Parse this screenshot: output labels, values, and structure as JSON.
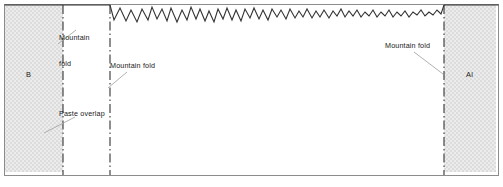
{
  "figure": {
    "type": "papercraft-fold-diagram",
    "frame": {
      "x": 4,
      "y": 4,
      "width": 495,
      "height": 172
    },
    "colors": {
      "line": "#333333",
      "frame": "#8c8c8c",
      "shading": "#e0e0e0",
      "leader": "#a8a8a8",
      "text": "#1a1a1a",
      "background": "#ffffff"
    }
  },
  "panels": [
    {
      "name": "left-tab-panel",
      "label": "B",
      "label_x": 26,
      "label_y": 70,
      "x": 4,
      "y": 4,
      "width": 59,
      "height": 168,
      "shaded": true
    },
    {
      "name": "right-tab-panel",
      "label": "Al",
      "label_x": 466,
      "label_y": 70,
      "x": 444,
      "y": 4,
      "width": 52,
      "height": 168,
      "shaded": true
    }
  ],
  "fold_lines": [
    {
      "name": "fold-line-left-panel-edge",
      "x": 63,
      "y1": 4,
      "y2": 174,
      "style": "dash-dot"
    },
    {
      "name": "fold-line-inner-left",
      "x": 110,
      "y1": 4,
      "y2": 174,
      "style": "dash-dot"
    },
    {
      "name": "fold-line-right-panel-edge",
      "x": 444,
      "y1": 4,
      "y2": 174,
      "style": "dash-dot"
    }
  ],
  "torn_edge": {
    "name": "ragged-torn-top-edge",
    "start_x": 110,
    "end_x": 444,
    "baseline_y": 18,
    "peak_y": 6,
    "note": "irregular zigzag; larger amplitude on the left, tighter and shallower toward the right"
  },
  "annotations": [
    {
      "name": "annotation-mountain-fold-top-left",
      "lines": [
        "Mountain",
        "fold"
      ],
      "text_x": 59,
      "text_y": 17,
      "leader": {
        "x1": 58,
        "y1": 44,
        "x2": 76,
        "y2": 30
      }
    },
    {
      "name": "annotation-mountain-fold-inner-left",
      "lines": [
        "Mountain fold"
      ],
      "text_x": 110,
      "text_y": 62,
      "leader": {
        "x1": 108,
        "y1": 88,
        "x2": 127,
        "y2": 72
      }
    },
    {
      "name": "annotation-paste-overlap",
      "lines": [
        "Paste overlap"
      ],
      "text_x": 59,
      "text_y": 110,
      "leader": {
        "x1": 44,
        "y1": 133,
        "x2": 75,
        "y2": 117
      }
    },
    {
      "name": "annotation-mountain-fold-right",
      "lines": [
        "Mountain fold"
      ],
      "text_x": 385,
      "text_y": 42,
      "leader": {
        "x1": 443,
        "y1": 74,
        "x2": 414,
        "y2": 52
      }
    }
  ]
}
